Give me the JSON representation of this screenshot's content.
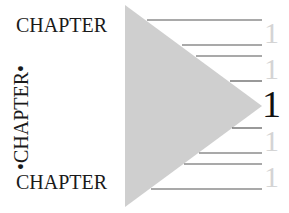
{
  "words": {
    "top": "CHAPTER",
    "vertical": "•CHAPTER•",
    "bottom": "CHAPTER"
  },
  "numbers": {
    "faded": [
      "1",
      "1",
      "1",
      "1"
    ],
    "main": "1"
  },
  "colors": {
    "triangle": "#cfcfcf",
    "lines": "#555555",
    "faded_digit": "#d4d4d4",
    "main_digit": "#111111",
    "text": "#1a1a1a"
  }
}
